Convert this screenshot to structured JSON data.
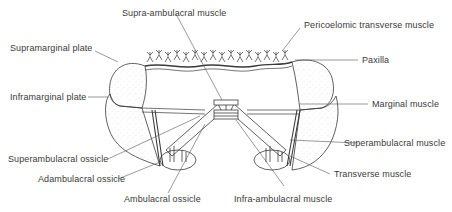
{
  "figure": {
    "colors": {
      "ink": "#3a3a3a",
      "stipple": "#9a9a9a",
      "background": "#ffffff"
    }
  },
  "labels": {
    "supra_ambulacral_muscle": "Supra-ambulacral muscle",
    "pericoelomic_transverse_muscle": "Pericoelomic transverse muscle",
    "supramarginal_plate": "Supramarginal plate",
    "paxilla": "Paxilla",
    "inframarginal_plate": "Inframarginal plate",
    "marginal_muscle": "Marginal muscle",
    "superambulacral_ossicle": "Superambulacral ossicle",
    "superambulacral_muscle": "Superambulacral muscle",
    "adambulacral_ossicle": "Adambulacral ossicle",
    "transverse_muscle": "Transverse muscle",
    "ambulacral_ossicle": "Ambulacral ossicle",
    "infra_ambulacral_muscle": "Infra-ambulacral muscle"
  }
}
